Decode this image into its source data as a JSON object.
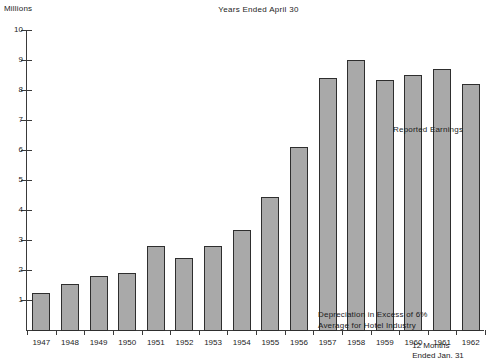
{
  "chart_data": {
    "type": "bar",
    "title": "Years Ended April 30",
    "xlabel": "",
    "ylabel": "Millions",
    "ylim": [
      0,
      10
    ],
    "yticks": [
      1,
      2,
      3,
      4,
      5,
      6,
      7,
      8,
      9,
      10
    ],
    "grid": false,
    "legend": "none",
    "categories": [
      "1947",
      "1948",
      "1949",
      "1950",
      "1951",
      "1952",
      "1953",
      "1954",
      "1955",
      "1956",
      "1957",
      "1958",
      "1959",
      "1960",
      "1961",
      "1962"
    ],
    "values": [
      1.25,
      1.55,
      1.8,
      1.9,
      2.8,
      2.4,
      2.8,
      3.35,
      4.45,
      6.1,
      8.4,
      9.0,
      8.35,
      8.5,
      8.7,
      8.2
    ],
    "series": [
      {
        "name": "Reported Earnings",
        "values": [
          1.25,
          1.55,
          1.8,
          1.9,
          2.8,
          2.4,
          2.8,
          3.35,
          4.45,
          6.1,
          8.4,
          9.0,
          8.35,
          8.5,
          8.7,
          8.2
        ]
      }
    ],
    "annotations": [
      {
        "id": "reported-earnings",
        "text": "Reported Earnings"
      },
      {
        "id": "depreciation",
        "text": "Depreciation in Excess of 6%\nAverage for Hotel Industry"
      }
    ],
    "footnote": "12 Months\nEnded Jan. 31",
    "bar_color": "#a9a9a9",
    "bar_border_color": "#2e2e2e",
    "axis_color": "#3a3a3a",
    "background_color": "#ffffff"
  }
}
